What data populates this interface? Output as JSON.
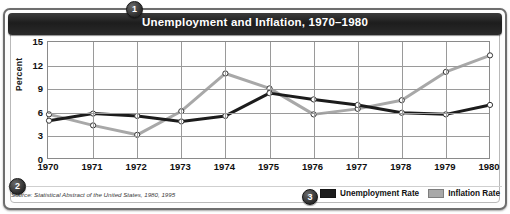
{
  "title": "Unemployment and Inflation, 1970–1980",
  "badges": {
    "one": "1",
    "two": "2",
    "three": "3"
  },
  "source": "Source: Statistical Abstract of the United States, 1980, 1995",
  "legend": [
    {
      "label": "Unemployment Rate",
      "color": "#1c1c1c"
    },
    {
      "label": "Inflation Rate",
      "color": "#a8a8a8"
    }
  ],
  "chart_data": {
    "type": "line",
    "title": "Unemployment and Inflation, 1970–1980",
    "xlabel": "",
    "ylabel": "Percent",
    "categories": [
      "1970",
      "1971",
      "1972",
      "1973",
      "1974",
      "1975",
      "1976",
      "1977",
      "1978",
      "1979",
      "1980"
    ],
    "yticks": [
      0,
      3,
      6,
      9,
      12,
      15
    ],
    "ylim": [
      0,
      15
    ],
    "grid": true,
    "legend_position": "bottom-right",
    "markers": "open-circle",
    "series": [
      {
        "name": "Unemployment Rate",
        "color": "#1c1c1c",
        "values": [
          5.0,
          5.9,
          5.6,
          4.9,
          5.6,
          8.5,
          7.7,
          7.0,
          6.0,
          5.8,
          7.0
        ]
      },
      {
        "name": "Inflation Rate",
        "color": "#a8a8a8",
        "values": [
          5.8,
          4.4,
          3.2,
          6.2,
          11.0,
          9.1,
          5.8,
          6.5,
          7.6,
          11.2,
          13.3
        ]
      }
    ]
  }
}
